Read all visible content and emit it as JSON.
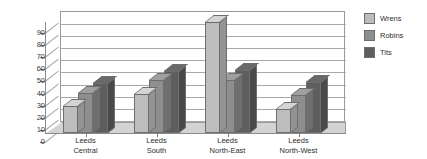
{
  "chart_data": {
    "type": "bar",
    "title": "",
    "xlabel": "",
    "ylabel": "",
    "ylim": [
      0,
      90
    ],
    "yticks": [
      0,
      10,
      20,
      30,
      40,
      50,
      60,
      70,
      80,
      90
    ],
    "grid": true,
    "legend_position": "right",
    "three_d": true,
    "categories": [
      "Leeds Central",
      "Leeds South",
      "Leeds North-East",
      "Leeds North-West"
    ],
    "category_lines": [
      [
        "Leeds",
        "Central"
      ],
      [
        "Leeds",
        "South"
      ],
      [
        "Leeds",
        "North-East"
      ],
      [
        "Leeds",
        "North-West"
      ]
    ],
    "series": [
      {
        "name": "Wrens",
        "color": "#bdbdbd",
        "values": [
          22,
          32,
          92,
          20
        ]
      },
      {
        "name": "Robins",
        "color": "#8e8e8e",
        "values": [
          33,
          44,
          44,
          31
        ]
      },
      {
        "name": "Tits",
        "color": "#5e5e5e",
        "values": [
          41,
          51,
          52,
          42
        ]
      }
    ]
  },
  "colors": {
    "background": "#ffffff",
    "gridline": "#a8a8a8",
    "axis": "#8a8a8a",
    "floor": "#d3d3d3",
    "bar_outline": "#6e6e6e",
    "text": "#2e2e2e"
  }
}
